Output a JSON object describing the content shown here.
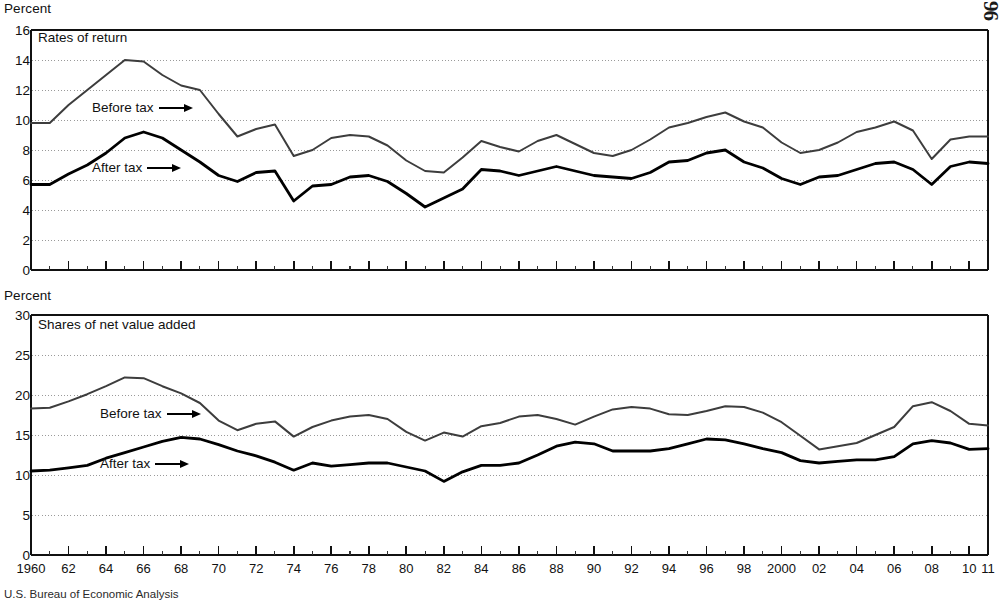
{
  "corner_mark": "96",
  "source_note": "U.S. Bureau of Economic Analysis",
  "axis_titles": {
    "top": "Percent",
    "bottom": "Percent"
  },
  "panels": {
    "top": {
      "caption": "Rates of return",
      "label_before": "Before tax",
      "label_after": "After tax"
    },
    "bottom": {
      "caption": "Shares of net value added",
      "label_before": "Before tax",
      "label_after": "After tax"
    }
  },
  "xaxis": {
    "tick_labels": [
      "1960",
      "62",
      "64",
      "66",
      "68",
      "70",
      "72",
      "74",
      "76",
      "78",
      "80",
      "82",
      "84",
      "86",
      "88",
      "90",
      "92",
      "94",
      "96",
      "98",
      "2000",
      "02",
      "04",
      "06",
      "08",
      "10",
      "11"
    ],
    "tick_years": [
      1960,
      1962,
      1964,
      1966,
      1968,
      1970,
      1972,
      1974,
      1976,
      1978,
      1980,
      1982,
      1984,
      1986,
      1988,
      1990,
      1992,
      1994,
      1996,
      1998,
      2000,
      2002,
      2004,
      2006,
      2008,
      2010,
      2011
    ]
  },
  "chart_data": [
    {
      "type": "line",
      "title": "Rates of return",
      "xlabel": "",
      "ylabel": "Percent",
      "ylim": [
        0,
        16
      ],
      "ytick_step": 2,
      "ytick_labels": [
        "0",
        "2",
        "4",
        "6",
        "8",
        "10",
        "12",
        "14",
        "16"
      ],
      "xlim": [
        1960,
        2011
      ],
      "grid": true,
      "legend": "inline-annotation",
      "x": [
        1960,
        1961,
        1962,
        1963,
        1964,
        1965,
        1966,
        1967,
        1968,
        1969,
        1970,
        1971,
        1972,
        1973,
        1974,
        1975,
        1976,
        1977,
        1978,
        1979,
        1980,
        1981,
        1982,
        1983,
        1984,
        1985,
        1986,
        1987,
        1988,
        1989,
        1990,
        1991,
        1992,
        1993,
        1994,
        1995,
        1996,
        1997,
        1998,
        1999,
        2000,
        2001,
        2002,
        2003,
        2004,
        2005,
        2006,
        2007,
        2008,
        2009,
        2010,
        2011
      ],
      "series": [
        {
          "name": "Before tax",
          "values": [
            9.8,
            9.8,
            11.0,
            12.0,
            13.0,
            14.0,
            13.9,
            13.0,
            12.3,
            12.0,
            10.4,
            8.9,
            9.4,
            9.7,
            7.6,
            8.0,
            8.8,
            9.0,
            8.9,
            8.3,
            7.3,
            6.6,
            6.5,
            7.5,
            8.6,
            8.2,
            7.9,
            8.6,
            9.0,
            8.4,
            7.8,
            7.6,
            8.0,
            8.7,
            9.5,
            9.8,
            10.2,
            10.5,
            9.9,
            9.5,
            8.5,
            7.8,
            8.0,
            8.5,
            9.2,
            9.5,
            9.9,
            9.3,
            7.4,
            8.7,
            8.9,
            8.9
          ]
        },
        {
          "name": "After tax",
          "values": [
            5.7,
            5.7,
            6.4,
            7.0,
            7.8,
            8.8,
            9.2,
            8.8,
            8.0,
            7.2,
            6.3,
            5.9,
            6.5,
            6.6,
            4.6,
            5.6,
            5.7,
            6.2,
            6.3,
            5.9,
            5.1,
            4.2,
            4.8,
            5.4,
            6.7,
            6.6,
            6.3,
            6.6,
            6.9,
            6.6,
            6.3,
            6.2,
            6.1,
            6.5,
            7.2,
            7.3,
            7.8,
            8.0,
            7.2,
            6.8,
            6.1,
            5.7,
            6.2,
            6.3,
            6.7,
            7.1,
            7.2,
            6.7,
            5.7,
            6.9,
            7.2,
            7.1
          ]
        }
      ]
    },
    {
      "type": "line",
      "title": "Shares of net value added",
      "xlabel": "",
      "ylabel": "Percent",
      "ylim": [
        0,
        30
      ],
      "ytick_step": 5,
      "ytick_labels": [
        "0",
        "5",
        "10",
        "15",
        "20",
        "25",
        "30"
      ],
      "xlim": [
        1960,
        2011
      ],
      "grid": true,
      "legend": "inline-annotation",
      "x": [
        1960,
        1961,
        1962,
        1963,
        1964,
        1965,
        1966,
        1967,
        1968,
        1969,
        1970,
        1971,
        1972,
        1973,
        1974,
        1975,
        1976,
        1977,
        1978,
        1979,
        1980,
        1981,
        1982,
        1983,
        1984,
        1985,
        1986,
        1987,
        1988,
        1989,
        1990,
        1991,
        1992,
        1993,
        1994,
        1995,
        1996,
        1997,
        1998,
        1999,
        2000,
        2001,
        2002,
        2003,
        2004,
        2005,
        2006,
        2007,
        2008,
        2009,
        2010,
        2011
      ],
      "series": [
        {
          "name": "Before tax",
          "values": [
            18.3,
            18.4,
            19.2,
            20.1,
            21.1,
            22.2,
            22.1,
            21.1,
            20.2,
            19.0,
            16.8,
            15.6,
            16.4,
            16.7,
            14.8,
            16.0,
            16.8,
            17.3,
            17.5,
            17.0,
            15.4,
            14.3,
            15.3,
            14.8,
            16.1,
            16.5,
            17.3,
            17.5,
            17.0,
            16.3,
            17.3,
            18.2,
            18.5,
            18.3,
            17.6,
            17.5,
            18.0,
            18.6,
            18.5,
            17.8,
            16.6,
            14.9,
            13.2,
            13.6,
            14.0,
            15.0,
            16.0,
            18.6,
            19.1,
            18.0,
            16.4,
            16.2,
            18.3,
            19.2
          ]
        },
        {
          "name": "After tax",
          "values": [
            10.5,
            10.6,
            10.9,
            11.2,
            12.1,
            12.8,
            13.5,
            14.2,
            14.7,
            14.5,
            13.8,
            13.0,
            12.4,
            11.6,
            10.6,
            11.5,
            11.1,
            11.3,
            11.5,
            11.5,
            11.0,
            10.5,
            9.2,
            10.4,
            11.2,
            11.2,
            11.5,
            12.5,
            13.6,
            14.1,
            13.9,
            13.0,
            13.0,
            13.0,
            13.3,
            13.9,
            14.5,
            14.4,
            13.9,
            13.3,
            12.8,
            11.8,
            11.5,
            11.7,
            11.9,
            11.9,
            12.3,
            13.9,
            14.3,
            14.0,
            13.2,
            13.3,
            14.6,
            15.2
          ]
        }
      ]
    }
  ]
}
